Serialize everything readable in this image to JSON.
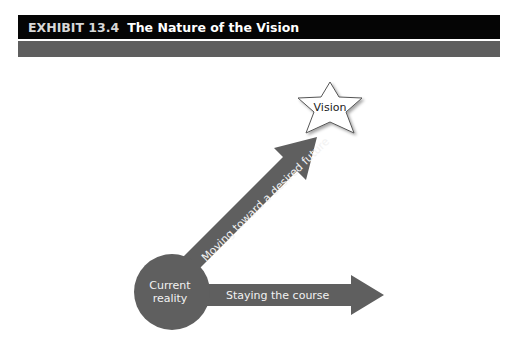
{
  "header": {
    "exhibit_number": "EXHIBIT 13.4",
    "title": "The Nature of the Vision"
  },
  "diagram": {
    "origin": {
      "label_line1": "Current",
      "label_line2": "reality"
    },
    "target": {
      "label": "Vision",
      "shape": "star"
    },
    "arrows": [
      {
        "id": "diagonal",
        "label": "Moving toward a desired future",
        "direction": "up-right",
        "points_to": "Vision"
      },
      {
        "id": "horizontal",
        "label": "Staying the course",
        "direction": "right"
      }
    ],
    "colors": {
      "title_bar": "#050505",
      "sub_bar": "#5e5e5e",
      "shape_fill": "#5f5f5f",
      "shape_text": "#f2f2f2",
      "star_fill": "#ffffff",
      "star_stroke": "#555555"
    }
  }
}
